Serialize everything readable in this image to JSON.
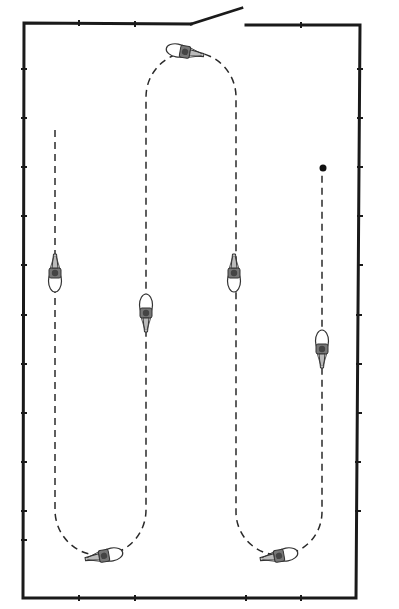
{
  "diagram": {
    "type": "arena-riding-pattern",
    "colors": {
      "background": "#ffffff",
      "wall": "#1a1a1a",
      "path": "#2a2a2a",
      "horse_outline": "#333333",
      "horse_fill": "#ffffff",
      "rider": "#555555",
      "end_marker": "#111111"
    },
    "arena": {
      "corners": {
        "tl": [
          24,
          23
        ],
        "tr": [
          360,
          25
        ],
        "br": [
          356,
          598
        ],
        "bl": [
          23,
          598
        ]
      },
      "door": {
        "gap_start_x": 191,
        "gap_end_x": 246,
        "swing_end": [
          242,
          8
        ]
      },
      "marker_ticks_left_y": [
        69,
        118,
        167,
        216,
        265,
        315,
        364,
        413,
        462,
        511,
        560
      ],
      "marker_ticks_right_y": [
        69,
        118,
        167,
        216,
        265,
        315,
        364,
        413,
        462,
        511,
        560
      ],
      "marker_ticks_top_x": [
        79,
        135
      ],
      "marker_ticks_bottom_x": [
        79,
        135,
        246,
        301
      ]
    },
    "path": {
      "style": "dashed",
      "start": [
        55,
        130
      ],
      "end_marker": [
        323,
        168
      ],
      "loop_columns_x": [
        55,
        146,
        236,
        322
      ],
      "top_turn_y": 52,
      "bottom_turn_y": 555
    },
    "horses": [
      {
        "id": "horse-top-turn",
        "x": 186,
        "y": 52,
        "rotation": 100
      },
      {
        "id": "horse-left-down",
        "x": 55,
        "y": 270,
        "rotation": 180
      },
      {
        "id": "horse-col2-up",
        "x": 146,
        "y": 316,
        "rotation": 0
      },
      {
        "id": "horse-col3-down",
        "x": 234,
        "y": 270,
        "rotation": 180
      },
      {
        "id": "horse-right-up",
        "x": 322,
        "y": 350,
        "rotation": 0
      },
      {
        "id": "horse-bottom-left-turn",
        "x": 103,
        "y": 555,
        "rotation": 260
      },
      {
        "id": "horse-bottom-right-turn",
        "x": 280,
        "y": 555,
        "rotation": 260
      }
    ]
  }
}
